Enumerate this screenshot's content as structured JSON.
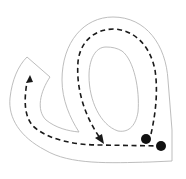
{
  "diagram": {
    "type": "letter-tracing-path",
    "colors": {
      "background": "#ffffff",
      "track_outline": "#b5b5b5",
      "guide_path": "#1a1a1a",
      "start_dots": "#111111"
    },
    "markers": [
      {
        "name": "start-dot-1",
        "x": 146,
        "y": 139
      },
      {
        "name": "start-dot-2",
        "x": 161,
        "y": 146
      }
    ],
    "arrows": [
      {
        "name": "arrow-down-loop",
        "x": 100,
        "y": 140,
        "direction": "down-right"
      },
      {
        "name": "arrow-up-left-arm",
        "x": 30,
        "y": 77,
        "direction": "up"
      }
    ]
  }
}
